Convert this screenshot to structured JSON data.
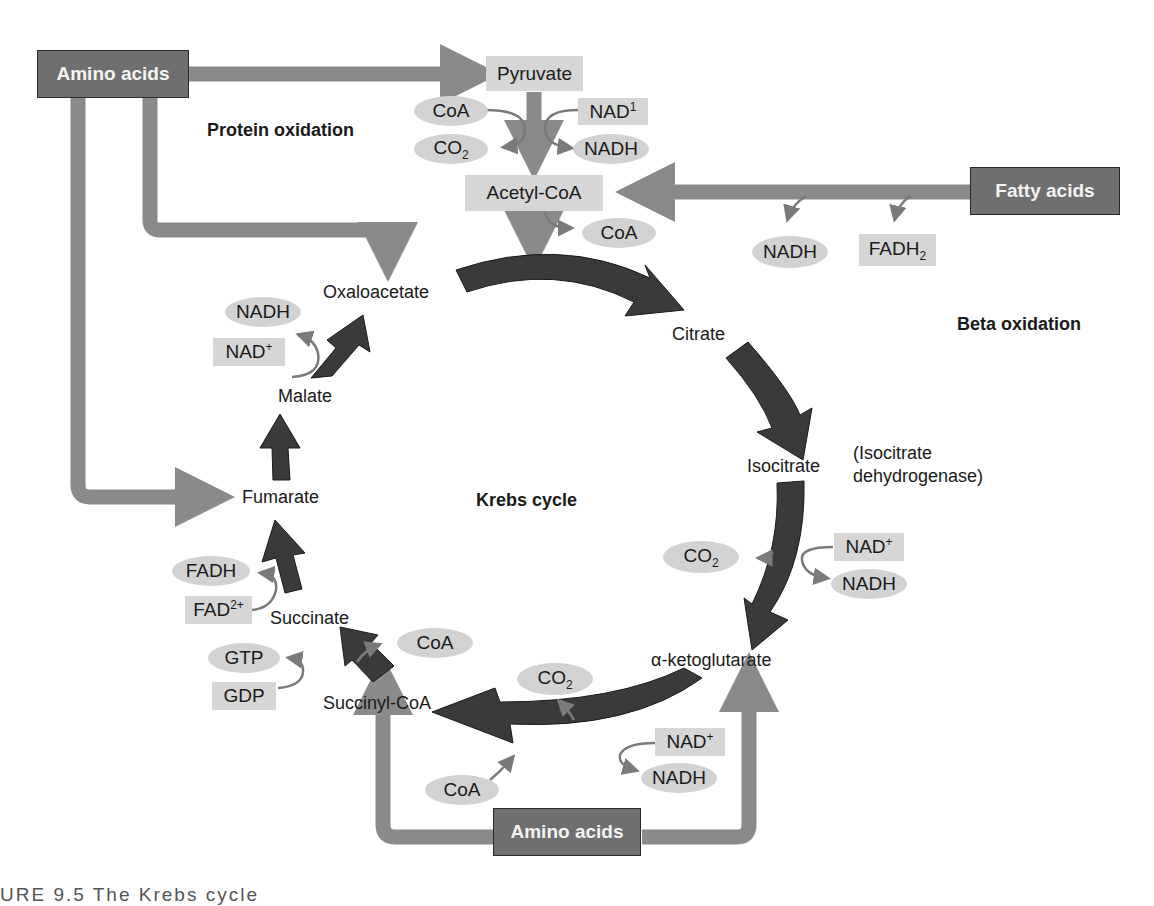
{
  "colors": {
    "pathway_arrow": "#8a8a8a",
    "cycle_arrow": "#3a3a3a",
    "source_box": "#6f6f6f",
    "label_box": "#d6d6d6",
    "oval": "#d2d2d2",
    "side_arrow": "#7a7a7a"
  },
  "sources": {
    "amino_acids_top": "Amino acids",
    "fatty_acids": "Fatty acids",
    "amino_acids_bottom": "Amino acids"
  },
  "section_labels": {
    "protein_oxidation": "Protein oxidation",
    "beta_oxidation": "Beta oxidation",
    "krebs_cycle": "Krebs cycle"
  },
  "pyruvate_step": {
    "pyruvate": "Pyruvate",
    "coa_in": "CoA",
    "co2_out": {
      "base": "CO",
      "sub": "2"
    },
    "nad_in": {
      "base": "NAD",
      "sup": "1"
    },
    "nadh_out": "NADH",
    "acetyl_coa": "Acetyl-CoA",
    "coa_out": "CoA"
  },
  "beta_oxidation_products": {
    "nadh": "NADH",
    "fadh2": {
      "base": "FADH",
      "sub": "2"
    }
  },
  "cycle": {
    "oxaloacetate": "Oxaloacetate",
    "citrate": "Citrate",
    "isocitrate": "Isocitrate",
    "enzyme_note_line1": "(Isocitrate",
    "enzyme_note_line2": "dehydrogenase)",
    "alpha_ketoglutarate": "α-ketoglutarate",
    "succinyl_coa": "Succinyl-CoA",
    "succinate": "Succinate",
    "fumarate": "Fumarate",
    "malate": "Malate"
  },
  "cofactors": {
    "malate_step": {
      "nadh": "NADH",
      "nad": {
        "base": "NAD",
        "sup": "+"
      }
    },
    "succinate_step": {
      "fadh": "FADH",
      "fad": {
        "base": "FAD",
        "sup": "2+"
      }
    },
    "succinyl_step": {
      "gtp": "GTP",
      "gdp": "GDP",
      "coa": "CoA"
    },
    "isocitrate_step": {
      "co2": {
        "base": "CO",
        "sub": "2"
      },
      "nad": {
        "base": "NAD",
        "sup": "+"
      },
      "nadh": "NADH"
    },
    "akg_step": {
      "co2": {
        "base": "CO",
        "sub": "2"
      },
      "nad": {
        "base": "NAD",
        "sup": "+"
      },
      "nadh": "NADH",
      "coa": "CoA"
    }
  },
  "caption_partial": "URE 9.5   The Krebs cycle"
}
